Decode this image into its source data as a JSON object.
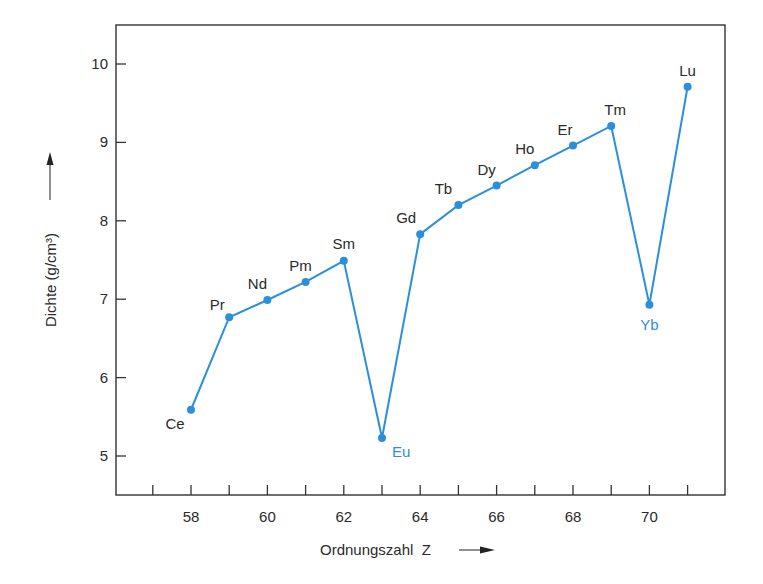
{
  "chart_data": {
    "type": "line",
    "title": "",
    "xlabel": "Ordnungszahl  Z",
    "ylabel": "Dichte (g/cm³)",
    "xlim": [
      56.0,
      72.0
    ],
    "ylim": [
      4.5,
      10.5
    ],
    "x_ticks_major": [
      58,
      60,
      62,
      64,
      66,
      68,
      70
    ],
    "x_ticks_minor": [
      57,
      58,
      59,
      60,
      61,
      62,
      63,
      64,
      65,
      66,
      67,
      68,
      69,
      70,
      71
    ],
    "y_ticks": [
      5,
      6,
      7,
      8,
      9,
      10
    ],
    "grid": false,
    "legend": null,
    "series": [
      {
        "name": "Lanthanoide",
        "color": "#2b8fdb",
        "x": [
          58,
          59,
          60,
          61,
          62,
          63,
          64,
          65,
          66,
          67,
          68,
          69,
          70,
          71
        ],
        "labels": [
          "Ce",
          "Pr",
          "Nd",
          "Pm",
          "Sm",
          "Eu",
          "Gd",
          "Tb",
          "Dy",
          "Ho",
          "Er",
          "Tm",
          "Yb",
          "Lu"
        ],
        "values": [
          5.59,
          6.77,
          6.99,
          7.22,
          7.49,
          5.23,
          7.83,
          8.2,
          8.45,
          8.71,
          8.96,
          9.21,
          6.93,
          9.71
        ],
        "highlighted": [
          "Eu",
          "Yb"
        ]
      }
    ]
  },
  "colors": {
    "series": "#2b8fdb",
    "axis": "#333333",
    "text": "#2a2a2a",
    "highlight_label": "#2b8fdb"
  }
}
